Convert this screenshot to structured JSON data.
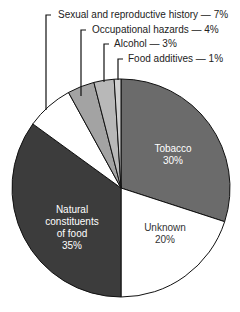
{
  "chart_data": {
    "type": "pie",
    "title": "",
    "start_angle_deg": 0,
    "direction": "clockwise",
    "slices": [
      {
        "label": "Tobacco",
        "value": 30,
        "color": "#6b6b6b",
        "label_position": "inside"
      },
      {
        "label": "Unknown",
        "value": 20,
        "color": "#ffffff",
        "label_position": "inside"
      },
      {
        "label": "Natural constituents of food",
        "value": 35,
        "color": "#3c3c3c",
        "label_position": "inside"
      },
      {
        "label": "Sexual and reproductive history",
        "value": 7,
        "color": "#ffffff",
        "label_position": "outside"
      },
      {
        "label": "Occupational hazards",
        "value": 4,
        "color": "#a3a3a3",
        "label_position": "outside"
      },
      {
        "label": "Alcohol",
        "value": 3,
        "color": "#b8b8b8",
        "label_position": "outside"
      },
      {
        "label": "Food additives",
        "value": 1,
        "color": "#d0d0d0",
        "label_position": "outside"
      }
    ],
    "legend": "none",
    "grid": false
  },
  "labels": {
    "outside": [
      "Sexual and reproductive history — 7%",
      "Occupational hazards — 4%",
      "Alcohol — 3%",
      "Food additives — 1%"
    ],
    "tobacco": {
      "name": "Tobacco",
      "pct": "30%"
    },
    "unknown": {
      "name": "Unknown",
      "pct": "20%"
    },
    "natural": {
      "line1": "Natural",
      "line2": "constituents",
      "line3": "of food",
      "pct": "35%"
    }
  }
}
